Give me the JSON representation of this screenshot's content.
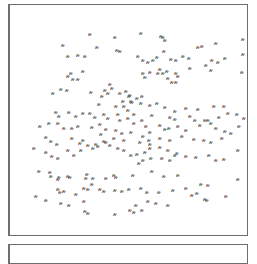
{
  "panels": {
    "main": {
      "label": "scatter-panel",
      "glyph_symbol": "ጽ",
      "glyph_color": "#555555"
    },
    "lower": {
      "label": "lower-panel"
    }
  },
  "glyphs": [
    [
      90,
      34
    ],
    [
      115,
      37
    ],
    [
      63,
      45
    ],
    [
      97,
      47
    ],
    [
      117,
      50
    ],
    [
      120,
      51
    ],
    [
      78,
      55
    ],
    [
      85,
      56
    ],
    [
      68,
      56
    ],
    [
      71,
      73
    ],
    [
      68,
      76
    ],
    [
      83,
      71
    ],
    [
      73,
      79
    ],
    [
      78,
      79
    ],
    [
      141,
      33
    ],
    [
      161,
      36
    ],
    [
      163,
      37
    ],
    [
      165,
      40
    ],
    [
      198,
      47
    ],
    [
      202,
      46
    ],
    [
      216,
      43
    ],
    [
      243,
      39
    ],
    [
      164,
      51
    ],
    [
      171,
      59
    ],
    [
      176,
      60
    ],
    [
      138,
      56
    ],
    [
      143,
      60
    ],
    [
      148,
      62
    ],
    [
      153,
      60
    ],
    [
      157,
      57
    ],
    [
      183,
      56
    ],
    [
      189,
      58
    ],
    [
      190,
      68
    ],
    [
      212,
      60
    ],
    [
      218,
      62
    ],
    [
      206,
      65
    ],
    [
      211,
      70
    ],
    [
      225,
      58
    ],
    [
      243,
      54
    ],
    [
      242,
      72
    ],
    [
      160,
      69
    ],
    [
      163,
      73
    ],
    [
      167,
      71
    ],
    [
      158,
      73
    ],
    [
      150,
      72
    ],
    [
      143,
      73
    ],
    [
      145,
      77
    ],
    [
      176,
      73
    ],
    [
      178,
      76
    ],
    [
      168,
      78
    ],
    [
      172,
      82
    ],
    [
      176,
      82
    ],
    [
      110,
      84
    ],
    [
      112,
      88
    ],
    [
      120,
      93
    ],
    [
      126,
      91
    ],
    [
      130,
      95
    ],
    [
      129,
      96
    ],
    [
      142,
      96
    ],
    [
      137,
      98
    ],
    [
      132,
      102
    ],
    [
      141,
      103
    ],
    [
      53,
      93
    ],
    [
      67,
      90
    ],
    [
      61,
      89
    ],
    [
      105,
      90
    ],
    [
      102,
      96
    ],
    [
      108,
      93
    ],
    [
      91,
      92
    ],
    [
      123,
      101
    ],
    [
      131,
      101
    ],
    [
      99,
      104
    ],
    [
      116,
      106
    ],
    [
      124,
      106
    ],
    [
      128,
      110
    ],
    [
      134,
      114
    ],
    [
      150,
      105
    ],
    [
      157,
      103
    ],
    [
      165,
      107
    ],
    [
      175,
      111
    ],
    [
      186,
      108
    ],
    [
      198,
      109
    ],
    [
      214,
      106
    ],
    [
      224,
      106
    ],
    [
      219,
      117
    ],
    [
      228,
      113
    ],
    [
      152,
      115
    ],
    [
      170,
      117
    ],
    [
      175,
      119
    ],
    [
      190,
      116
    ],
    [
      195,
      120
    ],
    [
      205,
      120
    ],
    [
      208,
      120
    ],
    [
      237,
      114
    ],
    [
      239,
      126
    ],
    [
      244,
      118
    ],
    [
      56,
      112
    ],
    [
      59,
      116
    ],
    [
      69,
      112
    ],
    [
      76,
      116
    ],
    [
      83,
      113
    ],
    [
      90,
      113
    ],
    [
      95,
      117
    ],
    [
      104,
      114
    ],
    [
      108,
      118
    ],
    [
      118,
      114
    ],
    [
      120,
      120
    ],
    [
      128,
      118
    ],
    [
      134,
      123
    ],
    [
      142,
      120
    ],
    [
      146,
      126
    ],
    [
      160,
      125
    ],
    [
      165,
      129
    ],
    [
      169,
      128
    ],
    [
      178,
      126
    ],
    [
      186,
      130
    ],
    [
      200,
      125
    ],
    [
      211,
      123
    ],
    [
      216,
      128
    ],
    [
      225,
      131
    ],
    [
      231,
      133
    ],
    [
      40,
      126
    ],
    [
      49,
      123
    ],
    [
      58,
      123
    ],
    [
      64,
      128
    ],
    [
      72,
      128
    ],
    [
      78,
      126
    ],
    [
      92,
      127
    ],
    [
      100,
      124
    ],
    [
      106,
      129
    ],
    [
      116,
      130
    ],
    [
      122,
      133
    ],
    [
      131,
      132
    ],
    [
      143,
      136
    ],
    [
      150,
      132
    ],
    [
      160,
      138
    ],
    [
      170,
      140
    ],
    [
      182,
      136
    ],
    [
      194,
      139
    ],
    [
      204,
      140
    ],
    [
      211,
      142
    ],
    [
      222,
      138
    ],
    [
      101,
      134
    ],
    [
      114,
      138
    ],
    [
      124,
      140
    ],
    [
      149,
      140
    ],
    [
      140,
      142
    ],
    [
      150,
      144
    ],
    [
      110,
      145
    ],
    [
      104,
      141
    ],
    [
      106,
      142
    ],
    [
      96,
      144
    ],
    [
      88,
      145
    ],
    [
      83,
      140
    ],
    [
      80,
      143
    ],
    [
      72,
      138
    ],
    [
      46,
      137
    ],
    [
      51,
      141
    ],
    [
      57,
      144
    ],
    [
      34,
      148
    ],
    [
      46,
      152
    ],
    [
      52,
      156
    ],
    [
      58,
      158
    ],
    [
      74,
      155
    ],
    [
      81,
      150
    ],
    [
      68,
      150
    ],
    [
      93,
      148
    ],
    [
      98,
      146
    ],
    [
      118,
      148
    ],
    [
      124,
      150
    ],
    [
      150,
      148
    ],
    [
      160,
      147
    ],
    [
      168,
      150
    ],
    [
      177,
      153
    ],
    [
      131,
      155
    ],
    [
      137,
      154
    ],
    [
      145,
      152
    ],
    [
      143,
      160
    ],
    [
      139,
      163
    ],
    [
      151,
      158
    ],
    [
      162,
      158
    ],
    [
      170,
      160
    ],
    [
      175,
      155
    ],
    [
      186,
      156
    ],
    [
      196,
      157
    ],
    [
      209,
      155
    ],
    [
      216,
      160
    ],
    [
      224,
      159
    ],
    [
      238,
      150
    ],
    [
      39,
      171
    ],
    [
      50,
      172
    ],
    [
      51,
      176
    ],
    [
      59,
      177
    ],
    [
      58,
      179
    ],
    [
      68,
      176
    ],
    [
      70,
      177
    ],
    [
      86,
      178
    ],
    [
      87,
      174
    ],
    [
      93,
      178
    ],
    [
      114,
      175
    ],
    [
      116,
      177
    ],
    [
      106,
      178
    ],
    [
      133,
      175
    ],
    [
      152,
      171
    ],
    [
      164,
      176
    ],
    [
      178,
      175
    ],
    [
      208,
      185
    ],
    [
      201,
      184
    ],
    [
      197,
      193
    ],
    [
      226,
      196
    ],
    [
      238,
      179
    ],
    [
      58,
      189
    ],
    [
      60,
      192
    ],
    [
      64,
      191
    ],
    [
      76,
      194
    ],
    [
      84,
      188
    ],
    [
      88,
      189
    ],
    [
      100,
      189
    ],
    [
      92,
      184
    ],
    [
      104,
      191
    ],
    [
      115,
      190
    ],
    [
      122,
      191
    ],
    [
      129,
      189
    ],
    [
      141,
      188
    ],
    [
      147,
      192
    ],
    [
      159,
      192
    ],
    [
      173,
      190
    ],
    [
      186,
      188
    ],
    [
      192,
      195
    ],
    [
      205,
      199
    ],
    [
      207,
      200
    ],
    [
      148,
      201
    ],
    [
      156,
      203
    ],
    [
      168,
      205
    ],
    [
      36,
      196
    ],
    [
      46,
      200
    ],
    [
      61,
      203
    ],
    [
      69,
      205
    ],
    [
      84,
      201
    ],
    [
      130,
      210
    ],
    [
      134,
      212
    ],
    [
      142,
      210
    ],
    [
      136,
      205
    ],
    [
      85,
      211
    ],
    [
      88,
      213
    ],
    [
      115,
      214
    ]
  ]
}
